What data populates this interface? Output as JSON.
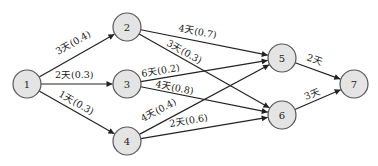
{
  "diagram": {
    "type": "activity-network",
    "nodes": [
      {
        "id": "1",
        "label": "1",
        "x": 27,
        "y": 84
      },
      {
        "id": "2",
        "label": "2",
        "x": 127,
        "y": 27
      },
      {
        "id": "3",
        "label": "3",
        "x": 127,
        "y": 84
      },
      {
        "id": "4",
        "label": "4",
        "x": 127,
        "y": 141
      },
      {
        "id": "5",
        "label": "5",
        "x": 282,
        "y": 58
      },
      {
        "id": "6",
        "label": "6",
        "x": 282,
        "y": 115
      },
      {
        "id": "7",
        "label": "7",
        "x": 354,
        "y": 84
      }
    ],
    "edges": [
      {
        "from": "1",
        "to": "2",
        "label": "3天(0.4)",
        "lx": 58,
        "ly": 55
      },
      {
        "from": "1",
        "to": "3",
        "label": "2天(0.3)",
        "lx": 55,
        "ly": 78
      },
      {
        "from": "1",
        "to": "4",
        "label": "1天(0.3)",
        "lx": 58,
        "ly": 96
      },
      {
        "from": "2",
        "to": "5",
        "label": "4天(0.7)",
        "lx": 178,
        "ly": 31
      },
      {
        "from": "2",
        "to": "6",
        "label": "3天(0.3)",
        "lx": 166,
        "ly": 45
      },
      {
        "from": "3",
        "to": "5",
        "label": "6天(0.2)",
        "lx": 142,
        "ly": 77
      },
      {
        "from": "3",
        "to": "6",
        "label": "4天(0.8)",
        "lx": 155,
        "ly": 87
      },
      {
        "from": "4",
        "to": "5",
        "label": "4天(0.4)",
        "lx": 143,
        "ly": 122
      },
      {
        "from": "4",
        "to": "6",
        "label": "2天(0.6)",
        "lx": 170,
        "ly": 127
      },
      {
        "from": "5",
        "to": "7",
        "label": "2天",
        "lx": 306,
        "ly": 60
      },
      {
        "from": "6",
        "to": "7",
        "label": "3天",
        "lx": 306,
        "ly": 100
      }
    ],
    "radius": 14,
    "colors": {
      "node_fill": "#e4e4e4",
      "node_stroke": "#555555",
      "edge": "#222222"
    }
  }
}
